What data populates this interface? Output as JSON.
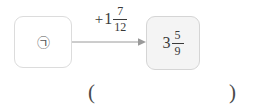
{
  "page": {
    "background_color": "#ffffff",
    "text_color": "#3a3a3a"
  },
  "diagram": {
    "type": "function-machine",
    "start_node": {
      "label": "㉠",
      "label_kind": "circled-korean-giyeok",
      "fill_color": "#ffffff",
      "border_color": "#dcdcdc"
    },
    "operation": {
      "sign": "+",
      "whole": "1",
      "numerator": "7",
      "denominator": "12",
      "plain_text": "+1 7/12"
    },
    "arrow": {
      "direction": "right",
      "color": "#9a9a9a"
    },
    "end_node": {
      "whole": "3",
      "numerator": "5",
      "denominator": "9",
      "plain_text": "3 5/9",
      "fill_color": "#f4f4f4",
      "border_color": "#d5d5d5"
    }
  },
  "answer": {
    "open_paren": "(",
    "close_paren": ")",
    "value": ""
  }
}
